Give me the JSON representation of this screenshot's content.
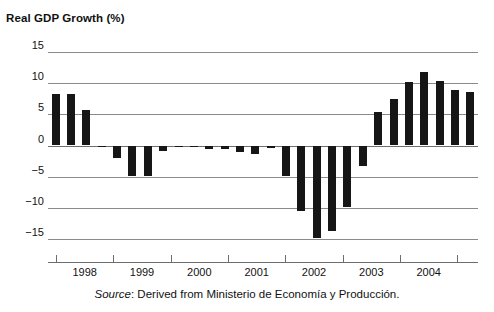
{
  "partial_top_line": "",
  "chart_title": "Real GDP Growth (%)",
  "source_prefix": "Source",
  "source_text": ": Derived from Ministerio de Economía y Producción.",
  "colors": {
    "bar": "#161616",
    "grid": "#8a8a8a",
    "axis": "#6e6e6e",
    "text": "#111111",
    "background": "#ffffff"
  },
  "chart_data": {
    "type": "bar",
    "title": "Real GDP Growth (%)",
    "xlabel": "",
    "ylabel": "Real GDP Growth (%)",
    "ylim": [
      -17.5,
      17.5
    ],
    "yticks": [
      15,
      10,
      5,
      0,
      -5,
      -10,
      -15
    ],
    "ytick_labels": [
      "15",
      "10",
      "5",
      "0",
      "−5",
      "−10",
      "−15"
    ],
    "grid": true,
    "legend": "none",
    "x_axis_type": "quarterly",
    "xtick_labels": [
      "1998",
      "1999",
      "2000",
      "2001",
      "2002",
      "2003",
      "2004"
    ],
    "categories": [
      "1997Q3",
      "1997Q4",
      "1998Q1",
      "1998Q2",
      "1998Q3",
      "1998Q4",
      "1999Q1",
      "1999Q2",
      "1999Q3",
      "1999Q4",
      "2000Q1",
      "2000Q2",
      "2000Q3",
      "2000Q4",
      "2001Q1",
      "2001Q2",
      "2001Q3",
      "2001Q4",
      "2002Q1",
      "2002Q2",
      "2002Q3",
      "2002Q4",
      "2003Q1",
      "2003Q2",
      "2003Q3",
      "2003Q4",
      "2004Q1",
      "2004Q2"
    ],
    "values": [
      8.2,
      8.3,
      5.6,
      -0.3,
      -2.0,
      -4.8,
      -4.9,
      -0.8,
      -0.2,
      -0.3,
      -0.6,
      -0.5,
      -1.1,
      -1.3,
      -0.4,
      -4.9,
      -10.4,
      -14.8,
      -13.6,
      -9.8,
      -3.2,
      5.3,
      7.4,
      10.2,
      11.7,
      10.3,
      8.9,
      8.5
    ],
    "units": "percent"
  }
}
